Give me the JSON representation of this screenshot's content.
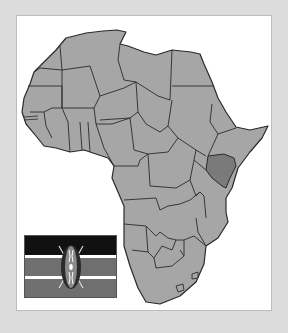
{
  "map": {
    "title": "Africa",
    "highlighted_country": "Kenya",
    "colors": {
      "background": "#dcdcdc",
      "frame": "#ffffff",
      "land": "#a6a6a6",
      "highlight": "#7a7a7a",
      "border": "#2a2a2a"
    }
  },
  "flag": {
    "country": "Kenya",
    "icon": "kenya-flag-icon",
    "bands": [
      "#111111",
      "#ffffff",
      "#6f6f6f",
      "#ffffff",
      "#6f6f6f"
    ]
  }
}
